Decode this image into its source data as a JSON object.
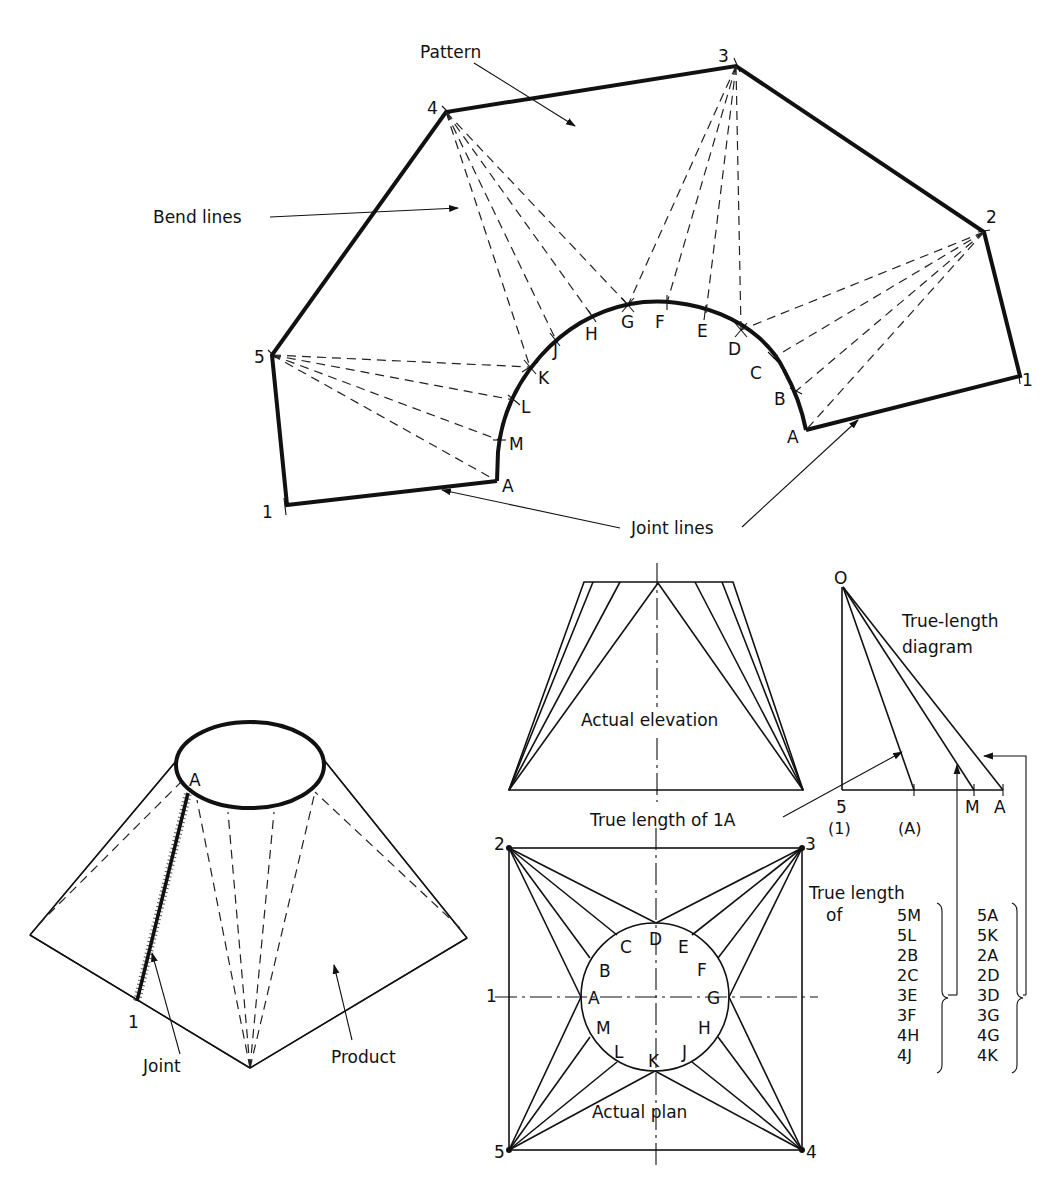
{
  "pattern": {
    "title": "Pattern",
    "bend_lines_label": "Bend lines",
    "joint_lines_label": "Joint lines",
    "corner_labels": [
      "1",
      "2",
      "3",
      "4",
      "5",
      "1"
    ],
    "curve_labels": [
      "A",
      "B",
      "C",
      "D",
      "E",
      "F",
      "G",
      "H",
      "J",
      "K",
      "L",
      "M",
      "A"
    ]
  },
  "product": {
    "label": "Product",
    "joint_label": "Joint",
    "point_1": "1",
    "point_a": "A"
  },
  "elevation": {
    "label": "Actual elevation",
    "true_length_label": "True length of 1A"
  },
  "true_length_diagram": {
    "title_line1": "True-length",
    "title_line2": "diagram",
    "origin": "O",
    "base_labels": [
      "5",
      "M",
      "A"
    ],
    "sub_labels": [
      "(1)",
      "(A)"
    ]
  },
  "plan": {
    "label": "Actual plan",
    "corners": [
      "1",
      "2",
      "3",
      "4",
      "5"
    ],
    "circle_points": [
      "A",
      "B",
      "C",
      "D",
      "E",
      "F",
      "G",
      "H",
      "J",
      "K",
      "L",
      "M"
    ]
  },
  "true_length_table": {
    "heading_line1": "True length",
    "heading_line2": "of",
    "column1": [
      "5M",
      "5L",
      "2B",
      "2C",
      "3E",
      "3F",
      "4H",
      "4J"
    ],
    "column2": [
      "5A",
      "5K",
      "2A",
      "2D",
      "3D",
      "3G",
      "4G",
      "4K"
    ]
  }
}
